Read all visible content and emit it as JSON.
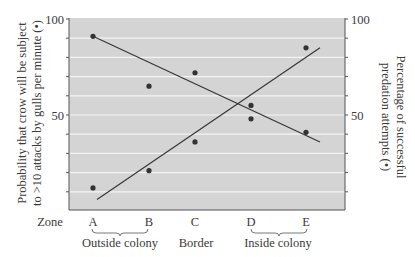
{
  "chart_data": {
    "type": "scatter",
    "title": "",
    "xlabel": "Zone",
    "categories": [
      "A",
      "B",
      "C",
      "D",
      "E"
    ],
    "zone_groups": [
      {
        "label": "Outside colony",
        "from": "A",
        "to": "B"
      },
      {
        "label": "Border",
        "from": "C",
        "to": "C"
      },
      {
        "label": "Inside colony",
        "from": "D",
        "to": "E"
      }
    ],
    "ylabel_left": "Probability that crow will be subject to >10 attacks by gulls per minute (•)",
    "ylabel_left_lines": [
      "Probability that crow will be subject",
      "to >10 attacks by gulls per minute (•)"
    ],
    "ylabel_right": "Percentage of successful predation attempts (•)",
    "ylabel_right_lines": [
      "Percentage of successful",
      "predation attempts (•)"
    ],
    "ylim": [
      0,
      100
    ],
    "y_ticks_labeled": [
      50,
      100
    ],
    "y_tick_step": 10,
    "grid": true,
    "series": [
      {
        "name": "Percentage of successful predation attempts",
        "axis": "right",
        "values": [
          91,
          65,
          72,
          48,
          41
        ],
        "trend_line": {
          "start": 91,
          "end": 36,
          "x_start": "A",
          "x_end": "E+"
        }
      },
      {
        "name": "Probability of >10 attacks by gulls per minute",
        "axis": "left",
        "values": [
          12,
          21,
          36,
          55,
          85
        ],
        "trend_line": {
          "start": 6,
          "end": 85,
          "x_start": "A",
          "x_end": "E+"
        }
      }
    ],
    "colors": {
      "plot_background": "#d4d4d4",
      "gridline": "#f4f4f4",
      "data": "#333333",
      "axis": "#555555"
    }
  },
  "labels": {
    "zone": "Zone",
    "y_left_100": "100",
    "y_left_50": "50",
    "y_right_100": "100",
    "y_right_50": "50",
    "groups": [
      "Outside colony",
      "Border",
      "Inside colony"
    ]
  }
}
